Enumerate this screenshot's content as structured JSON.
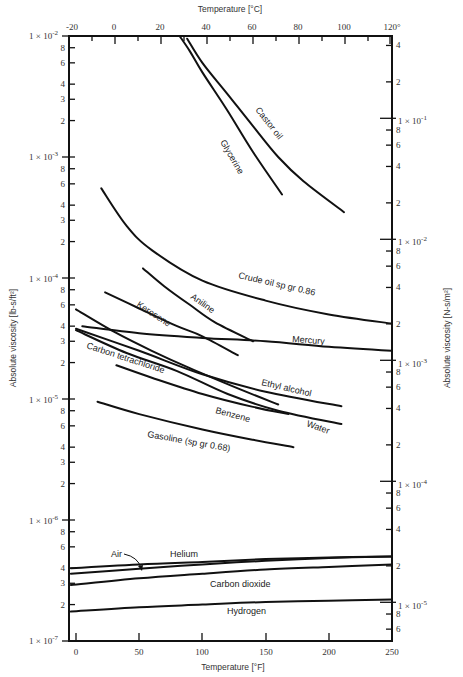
{
  "chart_data": {
    "type": "line",
    "title": "",
    "xlabel": "Temperature [°F]",
    "xlabel_top": "Temperature [°C]",
    "ylabel": "Absolute viscosity [lb-s/ft²]",
    "ylabel_right": "Absolute viscosity [N-s/m²]",
    "xscale": "linear",
    "yscale": "log",
    "xlim": [
      -4,
      250
    ],
    "ylim": [
      1e-07,
      0.01
    ],
    "xlim_top_C": [
      -20,
      120
    ],
    "grid": false,
    "legend": "none (curves labeled inline)",
    "x_ticks_bottom": [
      "0",
      "50",
      "100",
      "150",
      "200",
      "250"
    ],
    "x_ticks_top": [
      "-20",
      "0",
      "20",
      "40",
      "60",
      "80",
      "100",
      "120"
    ],
    "y_ticks_left": [
      "1 × 10⁻²",
      "8",
      "6",
      "4",
      "3",
      "2",
      "1 × 10⁻³",
      "8",
      "6",
      "4",
      "3",
      "2",
      "1 × 10⁻⁴",
      "8",
      "6",
      "4",
      "3",
      "2",
      "1 × 10⁻⁵",
      "8",
      "6",
      "4",
      "3",
      "2",
      "1 × 10⁻⁶",
      "8",
      "6",
      "4",
      "3",
      "2",
      "1 × 10⁻⁷"
    ],
    "y_ticks_right": [
      "4",
      "2",
      "1 × 10⁻¹",
      "8",
      "6",
      "4",
      "2",
      "1 × 10⁻²",
      "8",
      "6",
      "4",
      "2",
      "1 × 10⁻³",
      "8",
      "6",
      "4",
      "2",
      "1 × 10⁻⁴",
      "8",
      "6",
      "4",
      "2",
      "1 × 10⁻⁵",
      "8",
      "6"
    ],
    "series": [
      {
        "name": "Castor oil",
        "x": [
          88,
          100,
          120,
          140,
          160,
          180,
          212
        ],
        "y": [
          0.0095,
          0.006,
          0.0033,
          0.0018,
          0.001,
          0.00063,
          0.00035
        ]
      },
      {
        "name": "Glycerine",
        "x": [
          82,
          90,
          100,
          120,
          140,
          163
        ],
        "y": [
          0.01,
          0.0075,
          0.005,
          0.0024,
          0.0011,
          0.00049
        ]
      },
      {
        "name": "Crude oil sp gr 0.86",
        "x": [
          20,
          40,
          60,
          100,
          150,
          200,
          250
        ],
        "y": [
          0.00055,
          0.00027,
          0.00017,
          9.5e-05,
          6.5e-05,
          5e-05,
          4.2e-05
        ]
      },
      {
        "name": "Aniline",
        "x": [
          53,
          70,
          90,
          110,
          140
        ],
        "y": [
          0.00012,
          8.5e-05,
          6e-05,
          4.3e-05,
          3e-05
        ]
      },
      {
        "name": "Kerosene",
        "x": [
          23,
          50,
          80,
          100,
          128
        ],
        "y": [
          7.6e-05,
          5.6e-05,
          4e-05,
          3.3e-05,
          2.3e-05
        ]
      },
      {
        "name": "Mercury",
        "x": [
          5,
          50,
          100,
          150,
          200,
          250
        ],
        "y": [
          4e-05,
          3.5e-05,
          3.2e-05,
          3e-05,
          2.7e-05,
          2.5e-05
        ]
      },
      {
        "name": "Carbon tetrachloride",
        "x": [
          0,
          30,
          60,
          90,
          130,
          160
        ],
        "y": [
          5.5e-05,
          3.6e-05,
          2.5e-05,
          1.8e-05,
          1.2e-05,
          9e-06
        ]
      },
      {
        "name": "Ethyl alcohol",
        "x": [
          0,
          50,
          100,
          150,
          210
        ],
        "y": [
          3.8e-05,
          2.5e-05,
          1.6e-05,
          1.15e-05,
          8.7e-06
        ]
      },
      {
        "name": "Water",
        "x": [
          0,
          40,
          80,
          120,
          160,
          210
        ],
        "y": [
          3.7e-05,
          2.4e-05,
          1.7e-05,
          1.1e-05,
          8e-06,
          6.2e-06
        ]
      },
      {
        "name": "Benzene",
        "x": [
          32,
          60,
          100,
          140,
          168
        ],
        "y": [
          1.9e-05,
          1.5e-05,
          1.1e-05,
          8.6e-06,
          7.5e-06
        ]
      },
      {
        "name": "Gasoline (sp gr 0.68)",
        "x": [
          17,
          50,
          100,
          140,
          172
        ],
        "y": [
          9.5e-06,
          7.5e-06,
          5.6e-06,
          4.6e-06,
          4e-06
        ]
      },
      {
        "name": "Helium",
        "x": [
          -4,
          50,
          100,
          150,
          200,
          250
        ],
        "y": [
          4e-07,
          4.3e-07,
          4.5e-07,
          4.75e-07,
          4.9e-07,
          5e-07
        ]
      },
      {
        "name": "Air",
        "x": [
          -4,
          50,
          100,
          150,
          200,
          250
        ],
        "y": [
          3.6e-07,
          3.95e-07,
          4.3e-07,
          4.6e-07,
          4.85e-07,
          5e-07
        ]
      },
      {
        "name": "Carbon dioxide",
        "x": [
          -4,
          50,
          100,
          150,
          200,
          250
        ],
        "y": [
          2.9e-07,
          3.3e-07,
          3.6e-07,
          3.9e-07,
          4.1e-07,
          4.3e-07
        ]
      },
      {
        "name": "Hydrogen",
        "x": [
          -4,
          50,
          100,
          150,
          200,
          250
        ],
        "y": [
          1.75e-07,
          1.9e-07,
          2e-07,
          2.1e-07,
          2.15e-07,
          2.2e-07
        ]
      }
    ],
    "annotations": [
      "Air (arrow pointing to curve)"
    ]
  },
  "labels": {
    "xlabel_bottom": "Temperature [°F]",
    "xlabel_top": "Temperature [°C]",
    "ylabel_left": "Absolute viscosity [lb-s/ft²]",
    "ylabel_right": "Absolute viscosity [N-s/m²]",
    "castor": "Castor oil",
    "glycerine": "Glycerine",
    "crude": "Crude oil sp gr 0.86",
    "aniline": "Aniline",
    "kerosene": "Kerosene",
    "mercury": "Mercury",
    "ccl4": "Carbon tetrachloride",
    "ethyl": "Ethyl alcohol",
    "water": "Water",
    "benzene": "Benzene",
    "gasoline": "Gasoline (sp gr 0.68)",
    "air": "Air",
    "helium": "Helium",
    "co2": "Carbon dioxide",
    "hydrogen": "Hydrogen"
  },
  "ticks": {
    "bottom": [
      "0",
      "50",
      "100",
      "150",
      "200",
      "250"
    ],
    "top": [
      "-20",
      "0",
      "20",
      "40",
      "60",
      "80",
      "100",
      "120°"
    ],
    "left_decades": [
      "1 × 10",
      "1 × 10",
      "1 × 10",
      "1 × 10",
      "1 × 10",
      "1 × 10"
    ],
    "left_exps": [
      "-2",
      "-3",
      "-4",
      "-5",
      "-6",
      "-7"
    ],
    "right_decades": [
      "1 × 10",
      "1 × 10",
      "1 × 10",
      "1 × 10",
      "1 × 10"
    ],
    "right_exps": [
      "-1",
      "-2",
      "-3",
      "-4",
      "-5"
    ]
  }
}
